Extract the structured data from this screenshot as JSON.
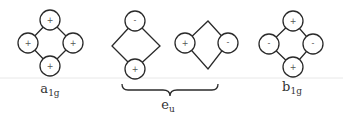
{
  "diagram": {
    "type": "symmetry-adapted orbital combinations (square planar)",
    "groups": [
      {
        "label_main": "a",
        "label_sub": "1g",
        "orbitals": {
          "top": "+",
          "left": "+",
          "right": "+",
          "bottom": "+"
        }
      },
      {
        "label_main": "e",
        "label_sub": "u",
        "pair": [
          {
            "top": "-",
            "bottom": "+"
          },
          {
            "left": "+",
            "right": "-"
          }
        ]
      },
      {
        "label_main": "b",
        "label_sub": "1g",
        "orbitals": {
          "top": "+",
          "left": "-",
          "right": "-",
          "bottom": "+"
        }
      }
    ]
  }
}
